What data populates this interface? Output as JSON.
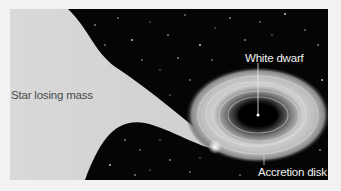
{
  "figure": {
    "labels": {
      "star": "Star losing mass",
      "white_dwarf": "White dwarf",
      "accretion_disk": "Accretion disk"
    },
    "colors": {
      "background": "#f2f2f2",
      "space": "#050505",
      "star": "#d4d4d4",
      "disk": "#cfcfcf",
      "label_on_star": "#4a4a4a",
      "label_on_space": "#f0f0f0"
    }
  }
}
